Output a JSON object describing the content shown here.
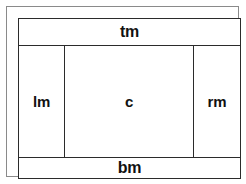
{
  "diagram": {
    "type": "page-box-model",
    "background_color": "#ffffff",
    "border_color": "#2b2b2b",
    "frame_color": "#8a8a8a",
    "text_color": "#111111",
    "regions": {
      "top_margin": {
        "label": "tm",
        "name": "top-margin"
      },
      "left_margin": {
        "label": "lm",
        "name": "left-margin"
      },
      "content": {
        "label": "c",
        "name": "content"
      },
      "right_margin": {
        "label": "rm",
        "name": "right-margin"
      },
      "bottom_margin": {
        "label": "bm",
        "name": "bottom-margin"
      }
    }
  }
}
